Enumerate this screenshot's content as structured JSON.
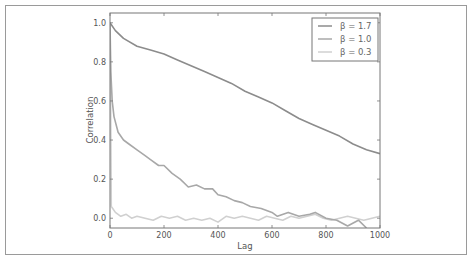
{
  "chart_data": {
    "type": "line",
    "title": "",
    "xlabel": "Lag",
    "ylabel": "Correlation",
    "xlim": [
      0,
      1000
    ],
    "ylim": [
      -0.05,
      1.05
    ],
    "xticks": [
      0,
      200,
      400,
      600,
      800,
      1000
    ],
    "xtick_labels": [
      "0",
      "200",
      "400",
      "600",
      "800",
      "1000"
    ],
    "yticks": [
      0.0,
      0.2,
      0.4,
      0.6,
      0.8,
      1.0
    ],
    "ytick_labels": [
      "0.0",
      "0.2",
      "0.4",
      "0.6",
      "0.8",
      "1.0"
    ],
    "grid": false,
    "legend_position": "upper right",
    "series": [
      {
        "name": "β = 1.7",
        "color": "#8c8c8c",
        "x": [
          0,
          20,
          50,
          100,
          150,
          200,
          250,
          300,
          350,
          400,
          450,
          500,
          550,
          600,
          650,
          700,
          750,
          800,
          850,
          900,
          950,
          1000
        ],
        "values": [
          1.0,
          0.96,
          0.92,
          0.88,
          0.86,
          0.84,
          0.81,
          0.78,
          0.75,
          0.72,
          0.69,
          0.65,
          0.62,
          0.59,
          0.55,
          0.51,
          0.48,
          0.45,
          0.42,
          0.38,
          0.35,
          0.33
        ]
      },
      {
        "name": "β = 1.0",
        "color": "#a8a8a8",
        "x": [
          0,
          3,
          8,
          15,
          30,
          50,
          70,
          100,
          130,
          150,
          180,
          200,
          230,
          260,
          290,
          320,
          350,
          380,
          400,
          430,
          460,
          490,
          520,
          560,
          600,
          620,
          660,
          700,
          740,
          760,
          800,
          840,
          880,
          920,
          950
        ],
        "values": [
          1.0,
          0.75,
          0.6,
          0.52,
          0.44,
          0.4,
          0.38,
          0.35,
          0.32,
          0.3,
          0.27,
          0.27,
          0.23,
          0.2,
          0.16,
          0.17,
          0.15,
          0.15,
          0.12,
          0.11,
          0.09,
          0.08,
          0.06,
          0.05,
          0.03,
          0.01,
          0.03,
          0.01,
          0.02,
          0.03,
          0.0,
          -0.01,
          -0.04,
          -0.01,
          -0.05
        ]
      },
      {
        "name": "β = 0.3",
        "color": "#d0d0d0",
        "x": [
          0,
          2,
          5,
          10,
          20,
          40,
          60,
          80,
          100,
          130,
          160,
          190,
          220,
          250,
          280,
          310,
          340,
          370,
          400,
          430,
          460,
          490,
          520,
          550,
          580,
          610,
          640,
          670,
          700,
          730,
          760,
          790,
          820,
          850,
          880,
          910,
          940,
          970,
          1000
        ],
        "values": [
          1.0,
          0.7,
          0.06,
          0.05,
          0.03,
          0.01,
          0.02,
          0.0,
          0.01,
          0.0,
          -0.01,
          0.01,
          0.0,
          0.01,
          -0.01,
          0.0,
          -0.01,
          0.0,
          -0.02,
          0.01,
          0.0,
          0.01,
          0.0,
          -0.01,
          0.01,
          0.0,
          -0.01,
          0.01,
          0.0,
          0.01,
          0.02,
          0.0,
          -0.01,
          0.0,
          0.01,
          0.0,
          -0.01,
          0.0,
          0.01
        ]
      }
    ]
  }
}
